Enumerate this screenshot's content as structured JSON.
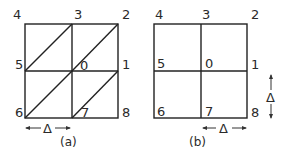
{
  "figure_a": {
    "caption": "(a)",
    "node_labels": {
      "n0": "0",
      "n1": "1",
      "n2": "2",
      "n3": "3",
      "n4": "4",
      "n5": "5",
      "n6": "6",
      "n7": "7",
      "n8": "8"
    },
    "spacing_label": "Δ",
    "description": "2x2 square grid with diagonal lines from lower-left to upper-right in each cell (triangulated mesh)"
  },
  "figure_b": {
    "caption": "(b)",
    "node_labels": {
      "n0": "0",
      "n1": "1",
      "n2": "2",
      "n3": "3",
      "n4": "4",
      "n5": "5",
      "n6": "6",
      "n7": "7",
      "n8": "8"
    },
    "horizontal_spacing_label": "Δ",
    "vertical_spacing_label": "Δ",
    "description": "2x2 square grid (rectangular mesh)"
  }
}
